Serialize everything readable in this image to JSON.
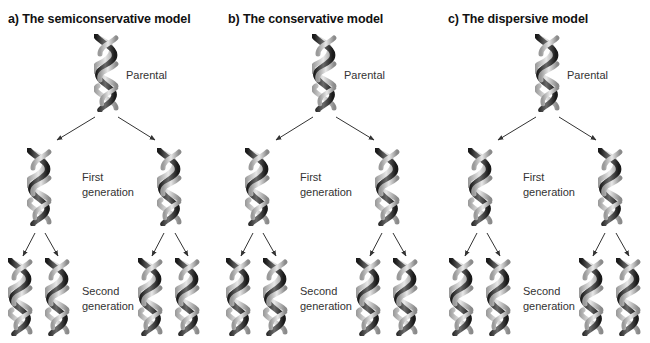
{
  "figure": {
    "panels": [
      {
        "id": "a",
        "title": "a) The semiconservative model",
        "labels": {
          "parental": "Parental",
          "first_line1": "First",
          "first_line2": "generation",
          "second_line1": "Second",
          "second_line2": "generation"
        }
      },
      {
        "id": "b",
        "title": "b) The conservative model",
        "labels": {
          "parental": "Parental",
          "first_line1": "First",
          "first_line2": "generation",
          "second_line1": "Second",
          "second_line2": "generation"
        }
      },
      {
        "id": "c",
        "title": "c) The dispersive model",
        "labels": {
          "parental": "Parental",
          "first_line1": "First",
          "first_line2": "generation",
          "second_line1": "Second",
          "second_line2": "generation"
        }
      }
    ],
    "icons": {
      "helix": "dna-double-helix-icon",
      "arrow": "arrow-icon"
    },
    "colors": {
      "strand_dark": "#2a2a2a",
      "strand_light": "#b8b8b8",
      "arrow": "#333333",
      "text": "#222222"
    }
  }
}
